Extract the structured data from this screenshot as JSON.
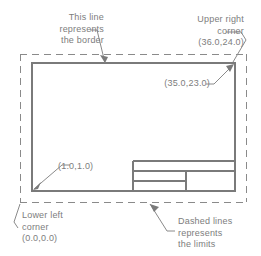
{
  "diagram": {
    "line_color": "#808080",
    "text_color": "#7d7d7d",
    "background": "#ffffff",
    "annotations": {
      "border_note": "This line\nrepresents\nthe border",
      "upper_right_note": "Upper right\ncorner\n(36.0,24.0)",
      "lower_left_note": "Lower left\ncorner\n(0.0,0.0)",
      "dashed_note": "Dashed lines\nrepresents\nthe limits"
    },
    "coordinates": {
      "inner_top_right": "(35.0,23.0)",
      "inner_bottom_left": "(1.0,1.0)",
      "outer_top_right": "(36.0,24.0)",
      "outer_bottom_left": "(0.0,0.0)"
    },
    "shapes": {
      "limits_rect": {
        "x": 20,
        "y": 54,
        "width": 226,
        "height": 148,
        "style": "dashed"
      },
      "border_rect": {
        "x": 32,
        "y": 63,
        "width": 203,
        "height": 128,
        "style": "solid"
      },
      "title_block": {
        "x": 133,
        "y": 161,
        "width": 102,
        "height": 30
      }
    }
  }
}
